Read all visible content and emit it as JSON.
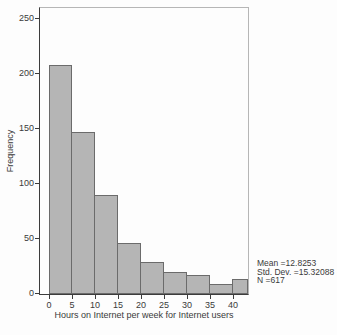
{
  "chart_data": {
    "type": "bar",
    "subtype": "histogram",
    "title": "",
    "xlabel": "Hours on Internet per week for Internet users",
    "ylabel": "Frequency",
    "bin_width": 5,
    "bin_starts": [
      0,
      5,
      10,
      15,
      20,
      25,
      30,
      35,
      40
    ],
    "values": [
      208,
      147,
      90,
      46,
      29,
      20,
      17,
      9,
      14
    ],
    "x_ticks": [
      0,
      5,
      10,
      15,
      20,
      25,
      30,
      35,
      40
    ],
    "y_ticks": [
      0,
      50,
      100,
      150,
      200,
      250
    ],
    "xlim": [
      -2,
      43.3
    ],
    "ylim": [
      0,
      260
    ],
    "grid": false,
    "legend": null,
    "last_bin_clipped_at_axis_edge": true,
    "annotations": {
      "mean": "Mean =12.8253",
      "std_dev": "Std. Dev. =15.32088",
      "n": "N =617"
    }
  },
  "colors": {
    "background": "#fdfdfd",
    "bar_fill": "#b5b5b5",
    "bar_border": "#6b6b6b",
    "axis": "#3c3c3c",
    "frame": "#b6b6b6",
    "text": "#3a3a3a"
  }
}
